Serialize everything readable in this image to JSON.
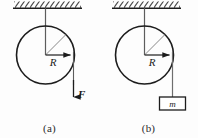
{
  "figure": {
    "type": "physics-diagram",
    "background_color": "#fdfdfd",
    "line_color": "#1c1c1c",
    "string_color": "#6e6e6e",
    "panels": [
      {
        "id": "a",
        "caption": "(a)",
        "ceiling": {
          "name": "hatched-ceiling",
          "hatch_direction": "up-right",
          "hatch_count": 13
        },
        "support_string": {
          "name": "support-string",
          "from": "ceiling",
          "to": "disk-center"
        },
        "disk": {
          "name": "disk",
          "center": [
            45,
            55
          ],
          "radius": 29
        },
        "radius_arrow": {
          "label": "R",
          "direction": "right",
          "note": "horizontal radius arrow from center to rim"
        },
        "radius_diagonal": {
          "note": "thin diagonal radius from center to upper-right rim"
        },
        "force": {
          "name": "applied-force",
          "label": "F",
          "direction": "down",
          "applied_at": "right rim of disk"
        }
      },
      {
        "id": "b",
        "caption": "(b)",
        "ceiling": {
          "name": "hatched-ceiling",
          "hatch_direction": "up-right",
          "hatch_count": 13
        },
        "support_string": {
          "name": "support-string",
          "from": "ceiling",
          "to": "disk-center"
        },
        "disk": {
          "name": "disk",
          "center": [
            45,
            55
          ],
          "radius": 29
        },
        "radius_arrow": {
          "label": "R",
          "direction": "right",
          "note": "horizontal radius arrow from center to rim"
        },
        "radius_diagonal": {
          "note": "thin diagonal radius from center to upper-right rim"
        },
        "hanging_mass": {
          "name": "hanging-mass-block",
          "label": "m",
          "hangs_from": "right rim of disk"
        }
      }
    ]
  }
}
